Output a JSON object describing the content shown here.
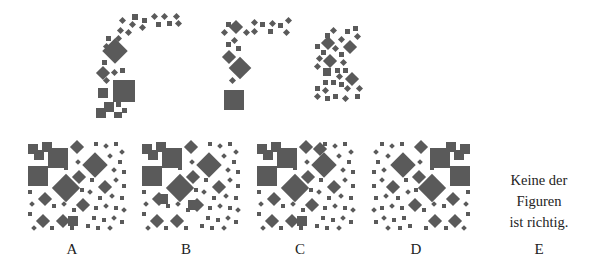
{
  "puzzle": {
    "type": "figure-assembly",
    "pieces": [
      {
        "id": "piece-1",
        "description": "L-shaped arc of squares and diamonds"
      },
      {
        "id": "piece-2",
        "description": "hook-shaped arc of squares and diamonds"
      },
      {
        "id": "piece-3",
        "description": "K-shaped cluster of small squares and diamonds"
      }
    ],
    "options": [
      {
        "label": "A"
      },
      {
        "label": "B"
      },
      {
        "label": "C"
      },
      {
        "label": "D"
      },
      {
        "label": "E",
        "text_lines": [
          "Keine der",
          "Figuren",
          "ist richtig."
        ]
      }
    ],
    "colors": {
      "shape": "#5a5a5a",
      "background": "#ffffff",
      "text": "#222222"
    }
  }
}
